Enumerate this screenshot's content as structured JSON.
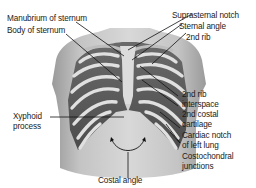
{
  "diagram": {
    "labels": {
      "manubrium": "Manubrium of sternum",
      "body_sternum": "Body of sternum",
      "suprasternal": "Suprasternal notch",
      "sternal_angle": "Sternal angle",
      "second_rib": "2nd rib",
      "rib_interspace_1": "2nd rib",
      "rib_interspace_2": "interspace",
      "costal_cartilage_1": "2nd costal",
      "costal_cartilage_2": "cartilage",
      "cardiac_notch_1": "Cardiac notch",
      "cardiac_notch_2": "of left lung",
      "costochondral_1": "Costochondral",
      "costochondral_2": "junctions",
      "xiphoid_1": "Xyphoid",
      "xiphoid_2": "process",
      "costal_angle": "Costal angle"
    },
    "colors": {
      "skin": "#c9c9c9",
      "skin_dark": "#8a8a8a",
      "rib": "#e2e2e2",
      "interspace": "#5a5a5a",
      "leader_line": "#111111",
      "text": "#1a1a1a"
    }
  }
}
